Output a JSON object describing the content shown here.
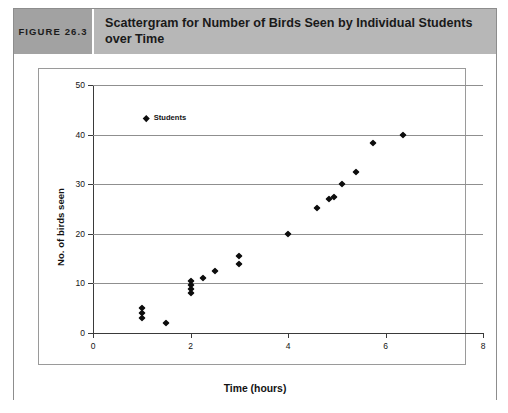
{
  "figure": {
    "number_label": "FIGURE 26.3",
    "title": "Scattergram for Number of Birds Seen by Individual Students over Time"
  },
  "chart_data": {
    "type": "scatter",
    "title": "Scattergram for Number of Birds Seen by Individual Students over Time",
    "xlabel": "Time (hours)",
    "ylabel": "No. of birds seen",
    "xlim": [
      0,
      8
    ],
    "ylim": [
      0,
      50
    ],
    "xticks": [
      0,
      2,
      4,
      6,
      8
    ],
    "yticks": [
      0,
      10,
      20,
      30,
      40,
      50
    ],
    "grid": "horizontal",
    "legend_position": "upper-left-inside",
    "series": [
      {
        "name": "Students",
        "marker": "diamond",
        "color": "#0d0d0d",
        "points": [
          {
            "x": 1.0,
            "y": 5.0
          },
          {
            "x": 1.0,
            "y": 4.0
          },
          {
            "x": 1.0,
            "y": 3.0
          },
          {
            "x": 1.5,
            "y": 2.0
          },
          {
            "x": 2.0,
            "y": 10.5
          },
          {
            "x": 2.0,
            "y": 9.6
          },
          {
            "x": 2.0,
            "y": 8.8
          },
          {
            "x": 2.0,
            "y": 8.0
          },
          {
            "x": 2.25,
            "y": 11.0
          },
          {
            "x": 2.5,
            "y": 12.5
          },
          {
            "x": 3.0,
            "y": 15.6
          },
          {
            "x": 3.0,
            "y": 14.0
          },
          {
            "x": 4.0,
            "y": 20.0
          },
          {
            "x": 4.6,
            "y": 25.2
          },
          {
            "x": 4.85,
            "y": 27.0
          },
          {
            "x": 4.95,
            "y": 27.4
          },
          {
            "x": 5.1,
            "y": 30.0
          },
          {
            "x": 5.4,
            "y": 32.4
          },
          {
            "x": 5.75,
            "y": 38.4
          },
          {
            "x": 6.35,
            "y": 40.0
          }
        ]
      }
    ]
  }
}
